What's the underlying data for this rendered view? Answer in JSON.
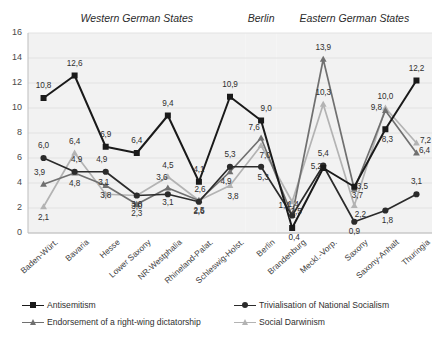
{
  "chart_data": {
    "type": "line",
    "title": "",
    "xlabel": "",
    "ylabel": "",
    "ylim": [
      0,
      16
    ],
    "ytick_step": 2,
    "yticks": [
      "0",
      "2",
      "4",
      "6",
      "8",
      "10",
      "12",
      "14",
      "16"
    ],
    "grid": true,
    "legend_position": "bottom",
    "categories": [
      "Baden-Würt.",
      "Bavaria",
      "Hesse",
      "Lower Saxony",
      "NR-Westphalia",
      "Rhineland-Palat.",
      "Schleswig-Holst.",
      "Berlin",
      "Brandenburg",
      "Meckl.-Vorp.",
      "Saxony",
      "Saxony-Anhalt",
      "Thuringia"
    ],
    "groups": [
      {
        "label": "Western German States",
        "start": 0,
        "end": 6
      },
      {
        "label": "Berlin",
        "start": 7,
        "end": 7
      },
      {
        "label": "Eastern German States",
        "start": 8,
        "end": 12
      }
    ],
    "series": [
      {
        "name": "Antisemitism",
        "marker": "square",
        "color": "#1a1a1a",
        "values": [
          10.8,
          12.6,
          6.9,
          6.4,
          9.4,
          4.1,
          10.9,
          9.0,
          0.4,
          5.2,
          3.7,
          8.3,
          12.2
        ],
        "labels": [
          "10,8",
          "12,6",
          "6,9",
          "6,4",
          "9,4",
          "4,1",
          "10,9",
          "9,0",
          "0,4",
          "5,2",
          "3,7",
          "8,3",
          "12,2"
        ]
      },
      {
        "name": "Trivialisation of National Socialism",
        "marker": "circle",
        "color": "#2b2b2b",
        "values": [
          6.0,
          4.9,
          4.9,
          3.0,
          3.1,
          2.5,
          5.3,
          5.3,
          1.4,
          5.4,
          0.9,
          1.8,
          3.1
        ],
        "labels": [
          "6,0",
          "4,9",
          "4,9",
          "3,0",
          "3,1",
          "2,5",
          "5,3",
          "5,3",
          "1,4",
          "5,4",
          "0,9",
          "1,8",
          "3,1"
        ]
      },
      {
        "name": "Endorsement of a right-wing dictatorship",
        "marker": "triangle",
        "color": "#707070",
        "values": [
          3.9,
          4.8,
          3.8,
          2.3,
          3.6,
          2.6,
          4.9,
          7.6,
          1.4,
          13.9,
          3.5,
          9.8,
          6.4
        ],
        "labels": [
          "3,9",
          "4,8",
          "3,8",
          "2,3",
          "3,6",
          "2,6",
          "4,9",
          "7,6",
          "1,4",
          "13,9",
          "3,5",
          "9,8",
          "6,4"
        ]
      },
      {
        "name": "Social Darwinism",
        "marker": "triangle",
        "color": "#b3b3b3",
        "values": [
          2.1,
          6.4,
          3.1,
          3.0,
          4.5,
          2.6,
          3.8,
          7.0,
          2.5,
          10.3,
          2.2,
          10.0,
          7.2
        ],
        "labels": [
          "2,1",
          "6,4",
          "3,1",
          "3,0",
          "4,5",
          "2,6",
          "3,8",
          "7,0",
          "2,5",
          "10,3",
          "2,2",
          "10,0",
          "7,2"
        ]
      }
    ]
  },
  "legend": {
    "items": [
      {
        "label": "Antisemitism",
        "color": "#1a1a1a",
        "marker": "square"
      },
      {
        "label": "Trivialisation of National Socialism",
        "color": "#2b2b2b",
        "marker": "circle"
      },
      {
        "label": "Endorsement of a right-wing dictatorship",
        "color": "#707070",
        "marker": "triangle"
      },
      {
        "label": "Social Darwinism",
        "color": "#b3b3b3",
        "marker": "triangle"
      }
    ]
  },
  "style": {
    "band_fill": "#f2f2f2",
    "grid_color": "#e2e2e2",
    "axis_color": "#bdbdbd",
    "background": "#ffffff"
  }
}
